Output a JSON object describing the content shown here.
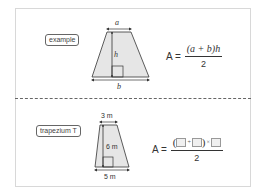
{
  "example": {
    "tag": "example",
    "shape": {
      "top_label": "a",
      "height_label": "h",
      "bottom_label": "b"
    },
    "formula": {
      "lhs": "A =",
      "numerator": "(a + b)h",
      "denominator": "2"
    }
  },
  "exercise": {
    "tag": "trapezium T",
    "shape": {
      "top_label": "3 m",
      "height_label": "6 m",
      "bottom_label": "5 m"
    },
    "formula": {
      "lhs": "A =",
      "open_paren": "(",
      "plus": "+",
      "close_paren": ")",
      "times": "×",
      "denominator": "2"
    }
  },
  "colors": {
    "fill": "#e6e6e6",
    "stroke": "#333333",
    "frame": "#d8d8d8"
  }
}
